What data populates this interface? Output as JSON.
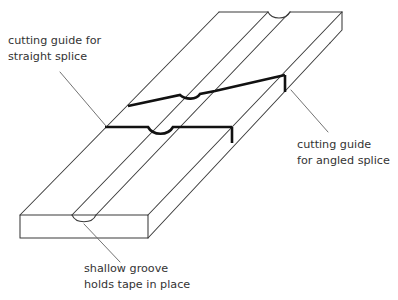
{
  "figure": {
    "background_color": "#ffffff",
    "line_color": "#3a3a3a",
    "guide_color": "#111111",
    "leader_color": "#6b6b6b",
    "text_color": "#333333"
  },
  "labels": {
    "straight_splice": {
      "name": "cutting-guide-straight-splice",
      "line1": "cutting guide for",
      "line2": "straight splice"
    },
    "angled_splice": {
      "name": "cutting-guide-angled-splice",
      "line1": "cutting guide",
      "line2": "for angled splice"
    },
    "groove": {
      "name": "shallow-groove",
      "line1": "shallow groove",
      "line2": "holds tape in place"
    }
  },
  "parts": [
    {
      "id": "block-body",
      "label": "splicing block body"
    },
    {
      "id": "top-face",
      "label": "top face"
    },
    {
      "id": "front-face",
      "label": "front end face"
    },
    {
      "id": "left-side-face",
      "label": "left long side face"
    },
    {
      "id": "groove-channel",
      "label": "shallow groove channel"
    },
    {
      "id": "groove-notch-front",
      "label": "groove notch at front end"
    },
    {
      "id": "groove-notch-back",
      "label": "groove notch at back end"
    },
    {
      "id": "guide-straight",
      "label": "straight splice cutting guide"
    },
    {
      "id": "guide-angled",
      "label": "angled splice cutting guide"
    }
  ]
}
